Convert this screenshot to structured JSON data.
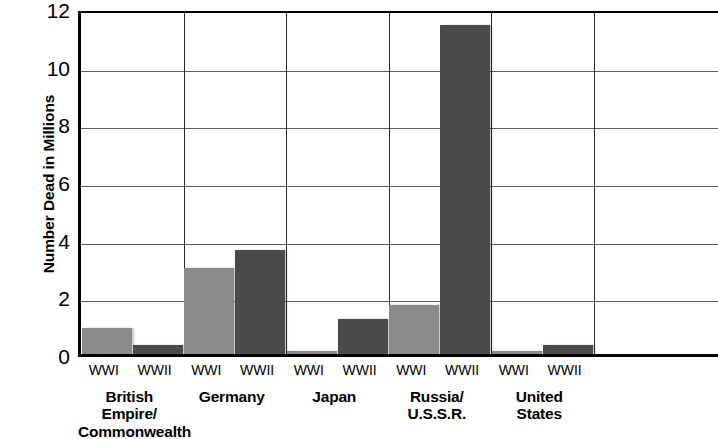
{
  "chart_data": {
    "type": "bar",
    "title": "",
    "xlabel": "",
    "ylabel": "Number Dead in Millions",
    "ylim": [
      0,
      12
    ],
    "ytick_labels": [
      "12",
      "10",
      "8",
      "6",
      "4",
      "2",
      "0"
    ],
    "ytick_values": [
      12,
      10,
      8,
      6,
      4,
      2,
      0
    ],
    "grid": true,
    "legend": "none",
    "categories": [
      "British Empire/\nCommonwealth",
      "Germany",
      "Japan",
      "Russia/\nU.S.S.R.",
      "United\nStates"
    ],
    "series": [
      {
        "name": "WWI",
        "values": [
          0.9,
          3.0,
          0.02,
          1.7,
          0.12
        ],
        "color": "#8a8a8a"
      },
      {
        "name": "WWII",
        "values": [
          0.3,
          3.6,
          1.2,
          11.4,
          0.3
        ],
        "color": "#4a4a4a"
      }
    ],
    "groups": [
      {
        "label": "British Empire/\nCommonwealth",
        "bars": [
          {
            "series": "WWI",
            "value": 0.9
          },
          {
            "series": "WWII",
            "value": 0.3
          }
        ]
      },
      {
        "label": "Germany",
        "bars": [
          {
            "series": "WWI",
            "value": 3.0
          },
          {
            "series": "WWII",
            "value": 3.6
          }
        ]
      },
      {
        "label": "Japan",
        "bars": [
          {
            "series": "WWI",
            "value": 0.02
          },
          {
            "series": "WWII",
            "value": 1.2
          }
        ]
      },
      {
        "label": "Russia/\nU.S.S.R.",
        "bars": [
          {
            "series": "WWI",
            "value": 1.7
          },
          {
            "series": "WWII",
            "value": 11.4
          }
        ]
      },
      {
        "label": "United\nStates",
        "bars": [
          {
            "series": "WWI",
            "value": 0.12
          },
          {
            "series": "WWII",
            "value": 0.3
          }
        ]
      }
    ]
  },
  "axis": {
    "y_title": "Number Dead in Millions",
    "ticks": [
      "12",
      "10",
      "8",
      "6",
      "4",
      "2",
      "0"
    ]
  },
  "series_tick_labels": [
    "WWI",
    "WWII"
  ],
  "group_labels": [
    "British Empire/\nCommonwealth",
    "Germany",
    "Japan",
    "Russia/\nU.S.S.R.",
    "United\nStates"
  ],
  "colors": {
    "wwi_bar": "#8a8a8a",
    "wwii_bar": "#4a4a4a",
    "axis": "#000000",
    "gridline": "#5a5a5a",
    "background": "#ffffff"
  }
}
